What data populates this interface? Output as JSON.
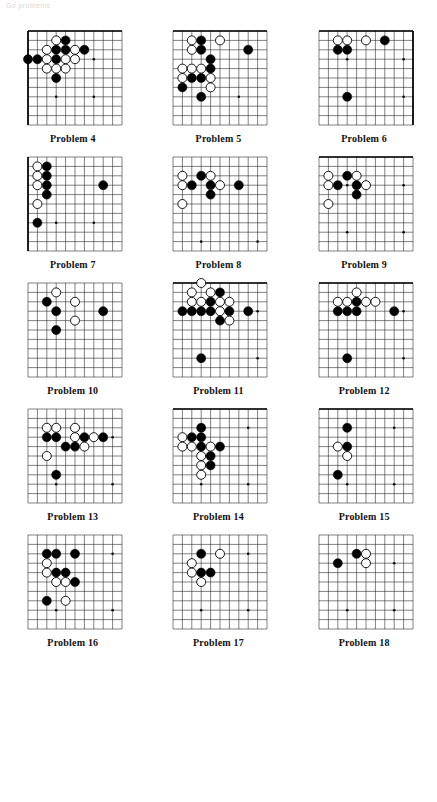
{
  "header": {
    "watermark": "Go problems"
  },
  "board_spec": {
    "lines": 11,
    "cell": 9.4,
    "margin": 7,
    "stone_radius": 4.5,
    "black_color": "#000000",
    "white_color": "#ffffff",
    "line_color": "#1a1a1a",
    "edge_color": "#000000",
    "note": "Each diagram shows an 11x11 visible section of a Go board corner; col/row are 0-indexed from the left/top of the visible section."
  },
  "problems": [
    {
      "id": 4,
      "caption": "Problem 4",
      "edges": [
        "top",
        "left"
      ],
      "star_points": [
        [
          3,
          7
        ],
        [
          7,
          3
        ],
        [
          7,
          7
        ]
      ],
      "stones": [
        {
          "color": "black",
          "col": 4,
          "row": 1
        },
        {
          "color": "white",
          "col": 3,
          "row": 1
        },
        {
          "color": "black",
          "col": 3,
          "row": 2
        },
        {
          "color": "black",
          "col": 4,
          "row": 2
        },
        {
          "color": "white",
          "col": 2,
          "row": 2
        },
        {
          "color": "white",
          "col": 5,
          "row": 2
        },
        {
          "color": "black",
          "col": 6,
          "row": 2
        },
        {
          "color": "black",
          "col": 0,
          "row": 3
        },
        {
          "color": "black",
          "col": 1,
          "row": 3
        },
        {
          "color": "black",
          "col": 3,
          "row": 3
        },
        {
          "color": "white",
          "col": 2,
          "row": 3
        },
        {
          "color": "white",
          "col": 4,
          "row": 3
        },
        {
          "color": "white",
          "col": 5,
          "row": 3
        },
        {
          "color": "white",
          "col": 2,
          "row": 4
        },
        {
          "color": "white",
          "col": 3,
          "row": 4
        },
        {
          "color": "white",
          "col": 4,
          "row": 4
        },
        {
          "color": "black",
          "col": 3,
          "row": 5
        }
      ]
    },
    {
      "id": 5,
      "caption": "Problem 5",
      "edges": [
        "top"
      ],
      "star_points": [
        [
          3,
          7
        ],
        [
          7,
          7
        ]
      ],
      "stones": [
        {
          "color": "white",
          "col": 2,
          "row": 1
        },
        {
          "color": "black",
          "col": 3,
          "row": 1
        },
        {
          "color": "white",
          "col": 5,
          "row": 1
        },
        {
          "color": "white",
          "col": 2,
          "row": 2
        },
        {
          "color": "black",
          "col": 3,
          "row": 2
        },
        {
          "color": "black",
          "col": 8,
          "row": 2
        },
        {
          "color": "black",
          "col": 4,
          "row": 3
        },
        {
          "color": "white",
          "col": 1,
          "row": 4
        },
        {
          "color": "white",
          "col": 2,
          "row": 4
        },
        {
          "color": "white",
          "col": 3,
          "row": 4
        },
        {
          "color": "black",
          "col": 4,
          "row": 4
        },
        {
          "color": "white",
          "col": 1,
          "row": 5
        },
        {
          "color": "black",
          "col": 2,
          "row": 5
        },
        {
          "color": "black",
          "col": 3,
          "row": 5
        },
        {
          "color": "white",
          "col": 4,
          "row": 5
        },
        {
          "color": "black",
          "col": 1,
          "row": 6
        },
        {
          "color": "white",
          "col": 4,
          "row": 6
        },
        {
          "color": "black",
          "col": 3,
          "row": 7
        }
      ]
    },
    {
      "id": 6,
      "caption": "Problem 6",
      "edges": [
        "top",
        "right"
      ],
      "star_points": [
        [
          3,
          3
        ],
        [
          3,
          7
        ],
        [
          9,
          3
        ],
        [
          9,
          7
        ]
      ],
      "stones": [
        {
          "color": "white",
          "col": 2,
          "row": 1
        },
        {
          "color": "white",
          "col": 3,
          "row": 1
        },
        {
          "color": "white",
          "col": 5,
          "row": 1
        },
        {
          "color": "black",
          "col": 7,
          "row": 1
        },
        {
          "color": "black",
          "col": 2,
          "row": 2
        },
        {
          "color": "black",
          "col": 3,
          "row": 2
        },
        {
          "color": "black",
          "col": 3,
          "row": 7
        }
      ]
    },
    {
      "id": 7,
      "caption": "Problem 7",
      "edges": [
        "left"
      ],
      "star_points": [
        [
          3,
          7
        ],
        [
          7,
          7
        ]
      ],
      "stones": [
        {
          "color": "white",
          "col": 1,
          "row": 1
        },
        {
          "color": "black",
          "col": 2,
          "row": 1
        },
        {
          "color": "white",
          "col": 1,
          "row": 2
        },
        {
          "color": "black",
          "col": 2,
          "row": 2
        },
        {
          "color": "white",
          "col": 1,
          "row": 3
        },
        {
          "color": "black",
          "col": 2,
          "row": 3
        },
        {
          "color": "black",
          "col": 2,
          "row": 4
        },
        {
          "color": "black",
          "col": 8,
          "row": 3
        },
        {
          "color": "white",
          "col": 1,
          "row": 5
        },
        {
          "color": "black",
          "col": 1,
          "row": 7
        }
      ]
    },
    {
      "id": 8,
      "caption": "Problem 8",
      "edges": [],
      "star_points": [
        [
          3,
          9
        ],
        [
          7,
          3
        ],
        [
          9,
          9
        ]
      ],
      "stones": [
        {
          "color": "white",
          "col": 1,
          "row": 2
        },
        {
          "color": "black",
          "col": 3,
          "row": 2
        },
        {
          "color": "white",
          "col": 4,
          "row": 2
        },
        {
          "color": "white",
          "col": 1,
          "row": 3
        },
        {
          "color": "black",
          "col": 2,
          "row": 3
        },
        {
          "color": "black",
          "col": 4,
          "row": 3
        },
        {
          "color": "white",
          "col": 5,
          "row": 3
        },
        {
          "color": "black",
          "col": 7,
          "row": 3
        },
        {
          "color": "black",
          "col": 4,
          "row": 4
        },
        {
          "color": "white",
          "col": 1,
          "row": 5
        }
      ]
    },
    {
      "id": 9,
      "caption": "Problem 9",
      "edges": [
        "top"
      ],
      "star_points": [
        [
          3,
          3
        ],
        [
          9,
          3
        ],
        [
          3,
          8
        ],
        [
          9,
          8
        ]
      ],
      "stones": [
        {
          "color": "white",
          "col": 1,
          "row": 2
        },
        {
          "color": "black",
          "col": 3,
          "row": 2
        },
        {
          "color": "white",
          "col": 4,
          "row": 2
        },
        {
          "color": "white",
          "col": 1,
          "row": 3
        },
        {
          "color": "black",
          "col": 2,
          "row": 3
        },
        {
          "color": "black",
          "col": 4,
          "row": 3
        },
        {
          "color": "white",
          "col": 5,
          "row": 3
        },
        {
          "color": "black",
          "col": 4,
          "row": 4
        },
        {
          "color": "white",
          "col": 1,
          "row": 5
        }
      ]
    },
    {
      "id": 10,
      "caption": "Problem 10",
      "edges": [],
      "star_points": [
        [
          8,
          3
        ]
      ],
      "stones": [
        {
          "color": "white",
          "col": 3,
          "row": 1
        },
        {
          "color": "black",
          "col": 2,
          "row": 2
        },
        {
          "color": "white",
          "col": 5,
          "row": 2
        },
        {
          "color": "black",
          "col": 3,
          "row": 3
        },
        {
          "color": "black",
          "col": 8,
          "row": 3
        },
        {
          "color": "white",
          "col": 5,
          "row": 4
        },
        {
          "color": "black",
          "col": 3,
          "row": 5
        }
      ]
    },
    {
      "id": 11,
      "caption": "Problem 11",
      "edges": [
        "top"
      ],
      "star_points": [
        [
          9,
          3
        ],
        [
          9,
          8
        ]
      ],
      "stones": [
        {
          "color": "white",
          "col": 3,
          "row": 0
        },
        {
          "color": "white",
          "col": 2,
          "row": 1
        },
        {
          "color": "white",
          "col": 4,
          "row": 1
        },
        {
          "color": "black",
          "col": 5,
          "row": 1
        },
        {
          "color": "white",
          "col": 2,
          "row": 2
        },
        {
          "color": "white",
          "col": 3,
          "row": 2
        },
        {
          "color": "black",
          "col": 4,
          "row": 2
        },
        {
          "color": "white",
          "col": 5,
          "row": 2
        },
        {
          "color": "white",
          "col": 6,
          "row": 2
        },
        {
          "color": "black",
          "col": 1,
          "row": 3
        },
        {
          "color": "black",
          "col": 2,
          "row": 3
        },
        {
          "color": "black",
          "col": 3,
          "row": 3
        },
        {
          "color": "black",
          "col": 4,
          "row": 3
        },
        {
          "color": "white",
          "col": 5,
          "row": 3
        },
        {
          "color": "black",
          "col": 6,
          "row": 3
        },
        {
          "color": "black",
          "col": 8,
          "row": 3
        },
        {
          "color": "black",
          "col": 5,
          "row": 4
        },
        {
          "color": "white",
          "col": 6,
          "row": 4
        },
        {
          "color": "black",
          "col": 3,
          "row": 8
        }
      ]
    },
    {
      "id": 12,
      "caption": "Problem 12",
      "edges": [
        "top"
      ],
      "star_points": [
        [
          9,
          3
        ],
        [
          9,
          8
        ]
      ],
      "stones": [
        {
          "color": "white",
          "col": 4,
          "row": 1
        },
        {
          "color": "white",
          "col": 2,
          "row": 2
        },
        {
          "color": "white",
          "col": 3,
          "row": 2
        },
        {
          "color": "black",
          "col": 4,
          "row": 2
        },
        {
          "color": "white",
          "col": 5,
          "row": 2
        },
        {
          "color": "white",
          "col": 6,
          "row": 2
        },
        {
          "color": "black",
          "col": 2,
          "row": 3
        },
        {
          "color": "black",
          "col": 3,
          "row": 3
        },
        {
          "color": "black",
          "col": 4,
          "row": 3
        },
        {
          "color": "black",
          "col": 8,
          "row": 3
        },
        {
          "color": "black",
          "col": 3,
          "row": 8
        }
      ]
    },
    {
      "id": 13,
      "caption": "Problem 13",
      "edges": [],
      "star_points": [
        [
          9,
          3
        ],
        [
          3,
          8
        ],
        [
          9,
          8
        ]
      ],
      "stones": [
        {
          "color": "white",
          "col": 2,
          "row": 2
        },
        {
          "color": "white",
          "col": 3,
          "row": 2
        },
        {
          "color": "white",
          "col": 5,
          "row": 2
        },
        {
          "color": "black",
          "col": 2,
          "row": 3
        },
        {
          "color": "black",
          "col": 3,
          "row": 3
        },
        {
          "color": "white",
          "col": 5,
          "row": 3
        },
        {
          "color": "black",
          "col": 6,
          "row": 3
        },
        {
          "color": "white",
          "col": 7,
          "row": 3
        },
        {
          "color": "black",
          "col": 8,
          "row": 3
        },
        {
          "color": "black",
          "col": 4,
          "row": 4
        },
        {
          "color": "black",
          "col": 5,
          "row": 4
        },
        {
          "color": "white",
          "col": 6,
          "row": 4
        },
        {
          "color": "white",
          "col": 2,
          "row": 5
        },
        {
          "color": "black",
          "col": 3,
          "row": 7
        }
      ]
    },
    {
      "id": 14,
      "caption": "Problem 14",
      "edges": [
        "top"
      ],
      "star_points": [
        [
          8,
          2
        ],
        [
          3,
          8
        ],
        [
          8,
          8
        ]
      ],
      "stones": [
        {
          "color": "black",
          "col": 3,
          "row": 2
        },
        {
          "color": "white",
          "col": 1,
          "row": 3
        },
        {
          "color": "black",
          "col": 2,
          "row": 3
        },
        {
          "color": "black",
          "col": 3,
          "row": 3
        },
        {
          "color": "white",
          "col": 1,
          "row": 4
        },
        {
          "color": "white",
          "col": 2,
          "row": 4
        },
        {
          "color": "black",
          "col": 3,
          "row": 4
        },
        {
          "color": "white",
          "col": 4,
          "row": 4
        },
        {
          "color": "black",
          "col": 5,
          "row": 4
        },
        {
          "color": "white",
          "col": 3,
          "row": 5
        },
        {
          "color": "black",
          "col": 4,
          "row": 5
        },
        {
          "color": "white",
          "col": 3,
          "row": 6
        },
        {
          "color": "black",
          "col": 4,
          "row": 6
        },
        {
          "color": "white",
          "col": 3,
          "row": 7
        }
      ]
    },
    {
      "id": 15,
      "caption": "Problem 15",
      "edges": [
        "top"
      ],
      "star_points": [
        [
          8,
          2
        ],
        [
          3,
          8
        ],
        [
          8,
          8
        ]
      ],
      "stones": [
        {
          "color": "black",
          "col": 3,
          "row": 2
        },
        {
          "color": "white",
          "col": 2,
          "row": 4
        },
        {
          "color": "black",
          "col": 3,
          "row": 4
        },
        {
          "color": "white",
          "col": 3,
          "row": 5
        },
        {
          "color": "black",
          "col": 2,
          "row": 7
        }
      ]
    },
    {
      "id": 16,
      "caption": "Problem 16",
      "edges": [],
      "star_points": [
        [
          9,
          2
        ],
        [
          3,
          8
        ],
        [
          9,
          8
        ]
      ],
      "stones": [
        {
          "color": "black",
          "col": 2,
          "row": 2
        },
        {
          "color": "black",
          "col": 3,
          "row": 2
        },
        {
          "color": "black",
          "col": 5,
          "row": 2
        },
        {
          "color": "white",
          "col": 2,
          "row": 3
        },
        {
          "color": "white",
          "col": 2,
          "row": 4
        },
        {
          "color": "black",
          "col": 3,
          "row": 4
        },
        {
          "color": "black",
          "col": 4,
          "row": 4
        },
        {
          "color": "white",
          "col": 3,
          "row": 5
        },
        {
          "color": "white",
          "col": 4,
          "row": 5
        },
        {
          "color": "black",
          "col": 5,
          "row": 5
        },
        {
          "color": "black",
          "col": 2,
          "row": 7
        },
        {
          "color": "white",
          "col": 4,
          "row": 7
        }
      ]
    },
    {
      "id": 17,
      "caption": "Problem 17",
      "edges": [],
      "star_points": [
        [
          8,
          2
        ],
        [
          3,
          8
        ],
        [
          8,
          8
        ]
      ],
      "stones": [
        {
          "color": "black",
          "col": 3,
          "row": 2
        },
        {
          "color": "white",
          "col": 5,
          "row": 2
        },
        {
          "color": "white",
          "col": 2,
          "row": 3
        },
        {
          "color": "white",
          "col": 2,
          "row": 4
        },
        {
          "color": "black",
          "col": 3,
          "row": 4
        },
        {
          "color": "black",
          "col": 4,
          "row": 4
        },
        {
          "color": "white",
          "col": 3,
          "row": 5
        }
      ]
    },
    {
      "id": 18,
      "caption": "Problem 18",
      "edges": [],
      "star_points": [
        [
          8,
          3
        ],
        [
          3,
          8
        ],
        [
          8,
          8
        ]
      ],
      "stones": [
        {
          "color": "black",
          "col": 4,
          "row": 2
        },
        {
          "color": "white",
          "col": 5,
          "row": 2
        },
        {
          "color": "black",
          "col": 2,
          "row": 3
        },
        {
          "color": "white",
          "col": 5,
          "row": 3
        }
      ]
    }
  ]
}
